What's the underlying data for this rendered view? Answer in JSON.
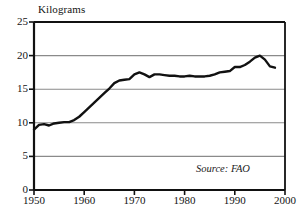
{
  "chart_data": {
    "type": "line",
    "title": "",
    "ylabel": "Kilograms",
    "xlabel": "",
    "ylim": [
      0,
      25
    ],
    "xlim": [
      1950,
      2000
    ],
    "yticks": [
      0,
      5,
      10,
      15,
      20,
      25
    ],
    "ytick_labels": [
      "0",
      "5",
      "10",
      "15",
      "20",
      "25"
    ],
    "xticks": [
      1950,
      1960,
      1970,
      1980,
      1990,
      2000
    ],
    "xtick_labels": [
      "1950",
      "1960",
      "1970",
      "1980",
      "1990",
      "2000"
    ],
    "grid": true,
    "grid_axis": "y",
    "legend": false,
    "annotations": [
      {
        "text": "Source: FAO",
        "style": "italic",
        "position": "bottom-right"
      }
    ],
    "series": [
      {
        "name": "World meat consumption per person",
        "color": "#111111",
        "x": [
          1950,
          1951,
          1952,
          1953,
          1954,
          1955,
          1956,
          1957,
          1958,
          1959,
          1960,
          1961,
          1962,
          1963,
          1964,
          1965,
          1966,
          1967,
          1968,
          1969,
          1970,
          1971,
          1972,
          1973,
          1974,
          1975,
          1976,
          1977,
          1978,
          1979,
          1980,
          1981,
          1982,
          1983,
          1984,
          1985,
          1986,
          1987,
          1988,
          1989,
          1990,
          1991,
          1992,
          1993,
          1994,
          1995,
          1996,
          1997,
          1998
        ],
        "values": [
          9.0,
          9.7,
          9.8,
          9.6,
          9.9,
          10.0,
          10.1,
          10.1,
          10.4,
          10.9,
          11.6,
          12.3,
          13.0,
          13.7,
          14.4,
          15.1,
          15.9,
          16.3,
          16.4,
          16.5,
          17.2,
          17.5,
          17.2,
          16.8,
          17.2,
          17.2,
          17.1,
          17.0,
          17.0,
          16.9,
          16.9,
          17.0,
          16.9,
          16.9,
          16.9,
          17.0,
          17.2,
          17.5,
          17.6,
          17.7,
          18.3,
          18.3,
          18.6,
          19.1,
          19.7,
          20.0,
          19.4,
          18.4,
          18.2
        ]
      }
    ]
  },
  "labels": {
    "y_axis_caption": "Kilograms",
    "source": "Source: FAO"
  }
}
